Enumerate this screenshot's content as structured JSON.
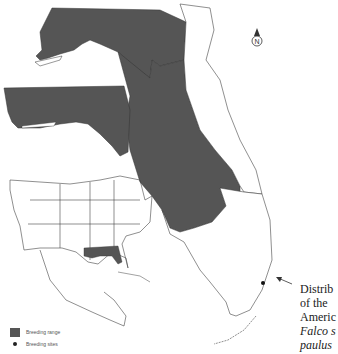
{
  "map": {
    "title_caption": {
      "line1": "Distrib",
      "line2": "of the",
      "line3": "Americ",
      "line4": "Falco s",
      "line5": "paulus"
    },
    "legend": {
      "items": [
        {
          "label": "Breeding range",
          "symbol": "gray-square"
        },
        {
          "label": "Breeding sites",
          "symbol": "black-dot"
        }
      ]
    },
    "north_arrow_label": "N",
    "colors": {
      "range_fill": "#555555",
      "outline": "#333333",
      "background": "#ffffff"
    },
    "insets": [
      "Florida panhandle inset",
      "United States locator map"
    ]
  }
}
